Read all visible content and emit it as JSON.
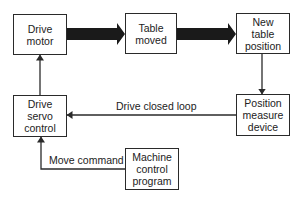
{
  "diagram": {
    "type": "block-diagram",
    "nodes": [
      {
        "id": "drive_motor",
        "label": "Drive\nmotor"
      },
      {
        "id": "table_moved",
        "label": "Table\nmoved"
      },
      {
        "id": "new_table_position",
        "label": "New\ntable\nposition"
      },
      {
        "id": "position_measure_device",
        "label": "Position\nmeasure\ndevice"
      },
      {
        "id": "drive_servo_control",
        "label": "Drive\nservo\ncontrol"
      },
      {
        "id": "machine_control_program",
        "label": "Machine\ncontrol\nprogram"
      }
    ],
    "edges": [
      {
        "from": "drive_motor",
        "to": "table_moved",
        "style": "thick"
      },
      {
        "from": "table_moved",
        "to": "new_table_position",
        "style": "thick"
      },
      {
        "from": "new_table_position",
        "to": "position_measure_device",
        "style": "thin"
      },
      {
        "from": "position_measure_device",
        "to": "drive_servo_control",
        "style": "thin",
        "label": "Drive closed loop"
      },
      {
        "from": "machine_control_program",
        "to": "drive_servo_control",
        "style": "thin",
        "label": "Move command"
      },
      {
        "from": "drive_servo_control",
        "to": "drive_motor",
        "style": "thin"
      }
    ],
    "edge_labels": {
      "closed_loop": "Drive closed loop",
      "move_command": "Move command"
    },
    "colors": {
      "line": "#2a2a2a",
      "thick_arrow": "#1a1a1a",
      "background": "#ffffff"
    }
  }
}
